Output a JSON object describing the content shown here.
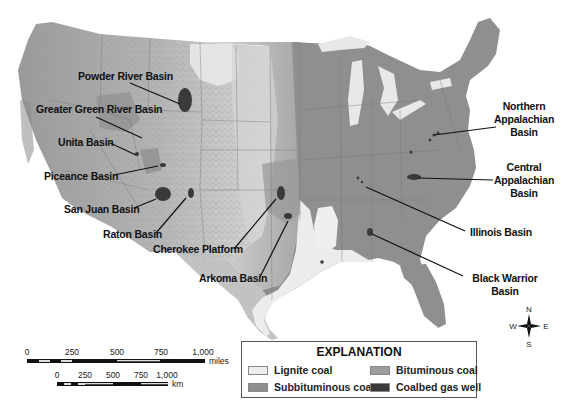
{
  "map": {
    "subject": "Coal regions and coalbed gas basins of the conterminous United States",
    "colors": {
      "background": "#ffffff",
      "lignite": "#eeeeee",
      "subbituminous": "#8e8e8e",
      "bituminous": "#9c9c9c",
      "coalbed_gas": "#3a3a3a",
      "terrain_light": "#c8c8c8",
      "terrain_mid": "#a8a8a8",
      "lakes": "#e6e6e6",
      "leader": "#111111"
    },
    "basins": [
      {
        "name": "Powder River Basin",
        "label": "Powder River Basin"
      },
      {
        "name": "Greater Green River Basin",
        "label": "Greater Green River Basin"
      },
      {
        "name": "Unita Basin",
        "label": "Unita Basin"
      },
      {
        "name": "Piceance Basin",
        "label": "Piceance Basin"
      },
      {
        "name": "San Juan Basin",
        "label": "San Juan Basin"
      },
      {
        "name": "Raton Basin",
        "label": "Raton Basin"
      },
      {
        "name": "Cherokee Platform",
        "label": "Cherokee Platform"
      },
      {
        "name": "Arkoma Basin",
        "label": "Arkoma Basin"
      },
      {
        "name": "Northern Appalachian Basin",
        "label_lines": [
          "Northern",
          "Appalachian",
          "Basin"
        ]
      },
      {
        "name": "Central Appalachian Basin",
        "label_lines": [
          "Central",
          "Appalachian",
          "Basin"
        ]
      },
      {
        "name": "Illinois Basin",
        "label": "Illinois Basin"
      },
      {
        "name": "Black Warrior Basin",
        "label_lines": [
          "Black Warrior",
          "Basin"
        ]
      }
    ]
  },
  "legend": {
    "title": "EXPLANATION",
    "items": [
      {
        "label": "Lignite coal",
        "color": "#eeeeee"
      },
      {
        "label": "Bituminous coal",
        "color": "#9c9c9c"
      },
      {
        "label": "Subbituminous coal",
        "color": "#8e8e8e"
      },
      {
        "label": "Coalbed gas well",
        "color": "#3a3a3a"
      }
    ]
  },
  "scale": {
    "miles": {
      "ticks": [
        "0",
        "250",
        "500",
        "750",
        "1,000"
      ],
      "unit": "miles"
    },
    "km": {
      "ticks": [
        "0",
        "250",
        "500",
        "750",
        "1,000"
      ],
      "unit": "km"
    }
  },
  "compass": {
    "n": "N",
    "s": "S",
    "e": "E",
    "w": "W"
  }
}
